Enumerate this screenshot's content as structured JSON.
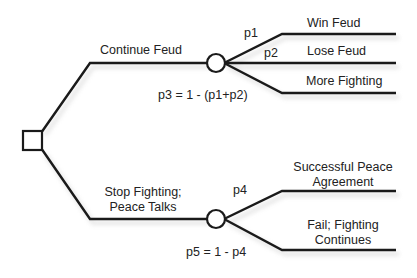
{
  "diagram": {
    "type": "decision-tree",
    "root": {
      "shape": "square",
      "kind": "decision-node"
    },
    "branches": [
      {
        "label": "Continue Feud",
        "chance_node": {
          "shape": "circle",
          "formula": "p3 = 1 - (p1+p2)"
        },
        "outcomes": [
          {
            "prob": "p1",
            "label": "Win Feud"
          },
          {
            "prob": "p2",
            "label": "Lose Feud"
          },
          {
            "prob": "",
            "label": "More Fighting"
          }
        ]
      },
      {
        "label_line1": "Stop Fighting;",
        "label_line2": "Peace Talks",
        "chance_node": {
          "shape": "circle",
          "formula": "p5 = 1 - p4"
        },
        "outcomes": [
          {
            "prob": "p4",
            "label_line1": "Successful Peace",
            "label_line2": "Agreement"
          },
          {
            "prob": "",
            "label_line1": "Fail; Fighting",
            "label_line2": "Continues"
          }
        ]
      }
    ],
    "colors": {
      "line": "#1a1a1a",
      "background": "#ffffff",
      "text": "#222222"
    }
  }
}
